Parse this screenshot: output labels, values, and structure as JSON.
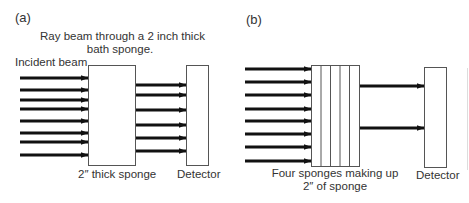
{
  "panels": [
    {
      "id": "a",
      "label": "(a)",
      "title_line1": "Ray beam through a 2 inch thick",
      "title_line2": "bath sponge.",
      "incident_label": "Incident beam",
      "sponge_label": "2″ thick sponge",
      "detector_label": "Detector",
      "incident_arrow_count": 8,
      "transmitted_arrow_count": 6,
      "sponge_layers": 1
    },
    {
      "id": "b",
      "label": "(b)",
      "sponge_label_line1": "Four sponges making up",
      "sponge_label_line2": "2″ of sponge",
      "detector_label": "Detector",
      "incident_arrow_count": 8,
      "transmitted_arrow_count": 2,
      "sponge_layers": 5
    }
  ],
  "colors": {
    "arrow": "#111111",
    "box_stroke": "#555555",
    "text": "#333333"
  }
}
